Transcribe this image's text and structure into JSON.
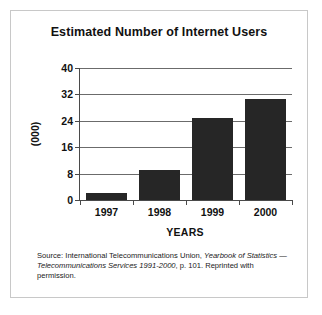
{
  "figure": {
    "title": "Estimated Number of Internet Users",
    "source_note_parts": {
      "lead": "Source: International Telecommunications Union, ",
      "italic_1": "Yearbook of Statistics — Telecommunications Services 1991-2000",
      "tail": ", p. 101. Reprinted with permission."
    },
    "frame_color": "#c8c8c8",
    "background_color": "#ffffff"
  },
  "chart_data": {
    "type": "bar",
    "title": "Estimated Number of Internet Users",
    "categories": [
      "1997",
      "1998",
      "1999",
      "2000"
    ],
    "values": [
      2,
      9,
      25,
      30.5
    ],
    "xlabel": "YEARS",
    "ylabel": "(000)",
    "ylim": [
      0,
      40
    ],
    "yticks": [
      0,
      8,
      16,
      24,
      32,
      40
    ],
    "ytick_labels": [
      "0",
      "8",
      "16",
      "24",
      "32",
      "40"
    ],
    "grid": true,
    "legend": false,
    "bar_color": "#262626",
    "axis_color": "#4a4a4a",
    "gridline_color": "#6b6b6b"
  }
}
